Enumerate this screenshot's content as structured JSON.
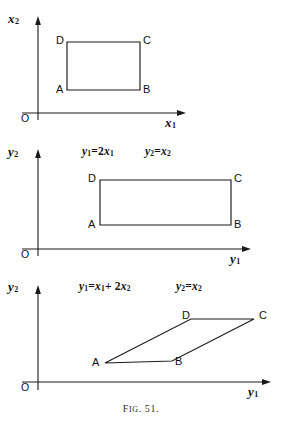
{
  "figure": {
    "caption_prefix": "F",
    "caption_small": "IG",
    "caption_rest": ". 51.",
    "caption_full": "Fig. 51.",
    "stroke_color": "#1a1a1a",
    "background": "#ffffff"
  },
  "panels": [
    {
      "id": "panel-1",
      "name": "original-xy-plane",
      "y_axis_label": "x",
      "y_axis_sub": "2",
      "x_axis_label": "x",
      "x_axis_sub": "1",
      "origin_label": "O",
      "equations": [],
      "shape": {
        "type": "rectangle",
        "vertices": [
          {
            "label": "A",
            "x": 67,
            "y": 90
          },
          {
            "label": "B",
            "x": 140,
            "y": 90
          },
          {
            "label": "C",
            "x": 140,
            "y": 42
          },
          {
            "label": "D",
            "x": 67,
            "y": 42
          }
        ]
      }
    },
    {
      "id": "panel-2",
      "name": "stretched-y-plane",
      "y_axis_label": "y",
      "y_axis_sub": "2",
      "x_axis_label": "y",
      "x_axis_sub": "1",
      "origin_label": "O",
      "equations": [
        {
          "lhs": "y",
          "lhs_sub": "1",
          "rhs": "2x",
          "rhs_sub": "1"
        },
        {
          "lhs": "y",
          "lhs_sub": "2",
          "rhs": "x",
          "rhs_sub": "2"
        }
      ],
      "shape": {
        "type": "rectangle",
        "vertices": [
          {
            "label": "A",
            "x": 100,
            "y": 225
          },
          {
            "label": "B",
            "x": 231,
            "y": 225
          },
          {
            "label": "C",
            "x": 231,
            "y": 180
          },
          {
            "label": "D",
            "x": 100,
            "y": 180
          }
        ]
      }
    },
    {
      "id": "panel-3",
      "name": "sheared-y-plane",
      "y_axis_label": "y",
      "y_axis_sub": "2",
      "x_axis_label": "y",
      "x_axis_sub": "1",
      "origin_label": "O",
      "equations": [
        {
          "lhs": "y",
          "lhs_sub": "1",
          "rhs": "x",
          "rhs_sub": "1",
          "rhs2": "+ 2x",
          "rhs2_sub": "2"
        },
        {
          "lhs": "y",
          "lhs_sub": "2",
          "rhs": "x",
          "rhs_sub": "2"
        }
      ],
      "shape": {
        "type": "parallelogram",
        "vertices": [
          {
            "label": "A",
            "x": 105,
            "y": 363
          },
          {
            "label": "B",
            "x": 172,
            "y": 361
          },
          {
            "label": "C",
            "x": 254,
            "y": 319
          },
          {
            "label": "D",
            "x": 191,
            "y": 319
          }
        ]
      }
    }
  ],
  "labels": {
    "origin": "O",
    "A": "A",
    "B": "B",
    "C": "C",
    "D": "D"
  },
  "equation_text": {
    "p2_eq1_lhs": "y",
    "p2_eq1_lhs_sub": "1",
    "p2_eq1_eq": "=2",
    "p2_eq1_var": "x",
    "p2_eq1_var_sub": "1",
    "p2_eq2_lhs": "y",
    "p2_eq2_lhs_sub": "2",
    "p2_eq2_eq": "=",
    "p2_eq2_var": "x",
    "p2_eq2_var_sub": "2",
    "p3_eq1_lhs": "y",
    "p3_eq1_lhs_sub": "1",
    "p3_eq1_eq": "=",
    "p3_eq1_var": "x",
    "p3_eq1_var_sub": "1",
    "p3_eq1_plus": "+ 2",
    "p3_eq1_var2": "x",
    "p3_eq1_var2_sub": "2",
    "p3_eq2_lhs": "y",
    "p3_eq2_lhs_sub": "2",
    "p3_eq2_eq": "=",
    "p3_eq2_var": "x",
    "p3_eq2_var_sub": "2"
  },
  "axis_labels": {
    "p1_y": "x",
    "p1_y_sub": "2",
    "p1_x": "x",
    "p1_x_sub": "1",
    "p2_y": "y",
    "p2_y_sub": "2",
    "p2_x": "y",
    "p2_x_sub": "1",
    "p3_y": "y",
    "p3_y_sub": "2",
    "p3_x": "y",
    "p3_x_sub": "1"
  }
}
